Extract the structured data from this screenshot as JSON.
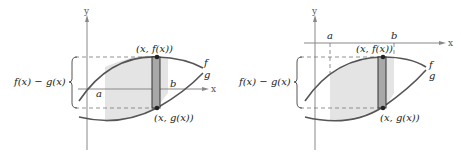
{
  "panels": [
    {
      "id": "left",
      "axis_labels": {
        "x": "x",
        "y": "y"
      },
      "bound_labels": {
        "a": "a",
        "b": "b"
      },
      "curve_labels": {
        "f": "f",
        "g": "g"
      },
      "point_labels": {
        "top": "(x, f(x))",
        "bottom": "(x, g(x))"
      },
      "height_label": "f(x) − g(x)"
    },
    {
      "id": "right",
      "axis_labels": {
        "x": "x",
        "y": "y"
      },
      "bound_labels": {
        "a": "a",
        "b": "b"
      },
      "curve_labels": {
        "f": "f",
        "g": "g"
      },
      "point_labels": {
        "top": "(x, f(x))",
        "bottom": "(x, g(x))"
      },
      "height_label": "f(x) − g(x)"
    }
  ],
  "colors": {
    "curve": "#555555",
    "axis": "#888888",
    "region_fill": "#e4e4e4",
    "strip_fill": "#a8a8a8",
    "strip_stroke": "#333333",
    "point": "#222222"
  }
}
